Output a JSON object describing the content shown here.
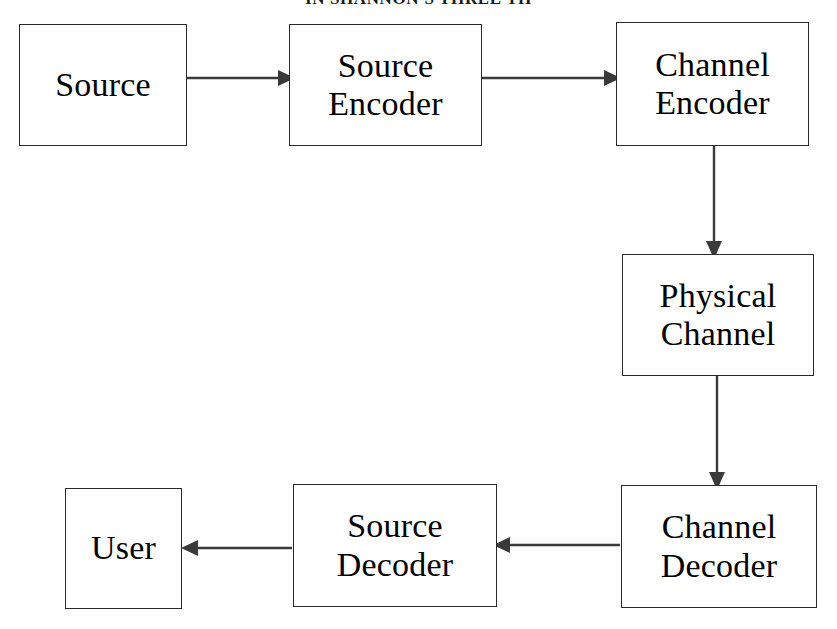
{
  "page": {
    "header_text": "IN SHANNON'S THREE TH",
    "background_color": "#ffffff",
    "line_color": "#3a3a3a",
    "box_border_color": "#2a2a2a",
    "text_color": "#000000",
    "width": 837,
    "height": 629
  },
  "diagram": {
    "type": "block-diagram",
    "nodes": [
      {
        "id": "source",
        "label": "Source"
      },
      {
        "id": "source_encoder",
        "label": "Source\nEncoder"
      },
      {
        "id": "channel_encoder",
        "label": "Channel\nEncoder"
      },
      {
        "id": "physical_channel",
        "label": "Physical\nChannel"
      },
      {
        "id": "channel_decoder",
        "label": "Channel\nDecoder"
      },
      {
        "id": "source_decoder",
        "label": "Source\nDecoder"
      },
      {
        "id": "user",
        "label": "User"
      }
    ],
    "edges": [
      {
        "from": "source",
        "to": "source_encoder",
        "direction": "right"
      },
      {
        "from": "source_encoder",
        "to": "channel_encoder",
        "direction": "right"
      },
      {
        "from": "channel_encoder",
        "to": "physical_channel",
        "direction": "down"
      },
      {
        "from": "physical_channel",
        "to": "channel_decoder",
        "direction": "down"
      },
      {
        "from": "channel_decoder",
        "to": "source_decoder",
        "direction": "left"
      },
      {
        "from": "source_decoder",
        "to": "user",
        "direction": "left"
      }
    ]
  }
}
